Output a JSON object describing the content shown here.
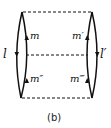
{
  "diagram": {
    "caption": "(b)",
    "labels": {
      "l": "l",
      "l_prime": "l′",
      "m": "m",
      "m_prime": "m′",
      "m_double": "m″",
      "m_triple": "m‴"
    },
    "colors": {
      "stroke": "#111111",
      "background": "#ffffff"
    }
  }
}
